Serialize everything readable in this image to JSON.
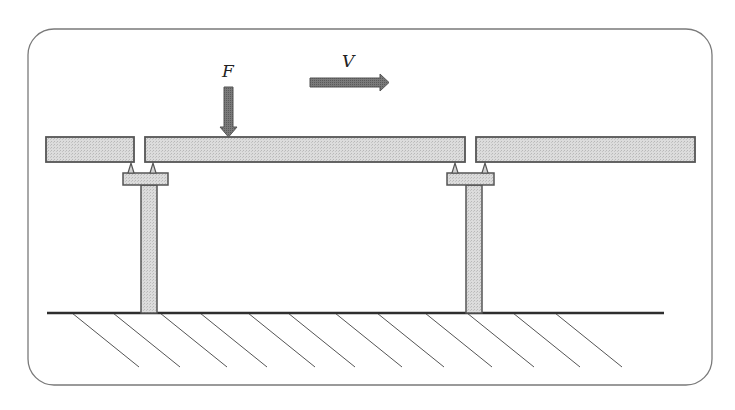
{
  "figure": {
    "type": "structural-diagram",
    "labels": {
      "force": "F",
      "velocity": "V"
    },
    "caption": "",
    "colors": {
      "frame": "#777777",
      "member_fill": "#d4d4d4",
      "member_stroke": "#555555",
      "arrow_fill": "#6e6e6e",
      "ground": "#333333",
      "hatch": "#555555"
    }
  },
  "beams": [
    {
      "name": "left-girder",
      "x": 46,
      "y": 137,
      "w": 88,
      "h": 25
    },
    {
      "name": "middle-girder",
      "x": 145,
      "y": 137,
      "w": 320,
      "h": 25
    },
    {
      "name": "right-girder",
      "x": 476,
      "y": 137,
      "w": 219,
      "h": 25
    }
  ],
  "piers": [
    {
      "name": "left-pier",
      "cap": {
        "x": 123,
        "y": 173,
        "w": 45,
        "h": 12
      },
      "column": {
        "x": 141,
        "y": 185,
        "w": 16,
        "h": 128
      },
      "bearings": [
        131,
        153
      ]
    },
    {
      "name": "right-pier",
      "cap": {
        "x": 447,
        "y": 173,
        "w": 47,
        "h": 12
      },
      "column": {
        "x": 466,
        "y": 185,
        "w": 16,
        "h": 128
      },
      "bearings": [
        455,
        485
      ]
    }
  ],
  "ground": {
    "x1": 47,
    "x2": 664,
    "y": 313
  },
  "hatch_starts": [
    72,
    113,
    160,
    200,
    248,
    288,
    335,
    377,
    425,
    467,
    513,
    555
  ]
}
